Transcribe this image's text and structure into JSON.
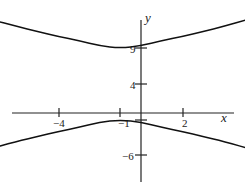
{
  "chart_data": {
    "type": "line",
    "title": "",
    "equation": "(y-4)^2/25 - (x+1)^2/b^2 = 1",
    "center": [
      -1,
      4
    ],
    "vertices": [
      [
        -1,
        9
      ],
      [
        -1,
        -1
      ]
    ],
    "xlabel": "x",
    "ylabel": "y",
    "x_ticks": [
      -4,
      -1,
      2
    ],
    "x_tick_labels": [
      "−4",
      "−1",
      "2"
    ],
    "y_ticks": [
      9,
      4,
      -1,
      -6
    ],
    "y_tick_labels": [
      "9",
      "4",
      "−1",
      "−6"
    ],
    "xlim": [
      -7.6,
      6.5
    ],
    "ylim": [
      -10,
      13
    ],
    "grid": false,
    "legend": null,
    "series": [
      {
        "name": "upper branch",
        "x": [
          -7.3,
          -6,
          -5,
          -4,
          -3,
          -2,
          -1,
          0,
          1,
          2,
          3,
          4,
          5.2
        ],
        "y": [
          13.0,
          12.0,
          11.3,
          10.6,
          10.0,
          9.3,
          9.0,
          9.3,
          10.0,
          10.6,
          11.3,
          12.0,
          13.0
        ]
      },
      {
        "name": "lower branch",
        "x": [
          -7.6,
          -6,
          -5,
          -4,
          -3,
          -2,
          -1,
          0,
          1,
          2,
          3,
          4,
          5.5
        ],
        "y": [
          -5.2,
          -4.0,
          -3.3,
          -2.6,
          -2.0,
          -1.3,
          -1.0,
          -1.3,
          -2.0,
          -2.6,
          -3.3,
          -4.0,
          -5.2
        ]
      }
    ]
  },
  "axes": {
    "x_label": "x",
    "y_label": "y",
    "x_ticks": [
      {
        "label": "−4"
      },
      {
        "label": "−1"
      },
      {
        "label": "2"
      }
    ],
    "y_ticks": [
      {
        "label": "9"
      },
      {
        "label": "4"
      },
      {
        "label": "−1"
      },
      {
        "label": "−6"
      }
    ]
  }
}
